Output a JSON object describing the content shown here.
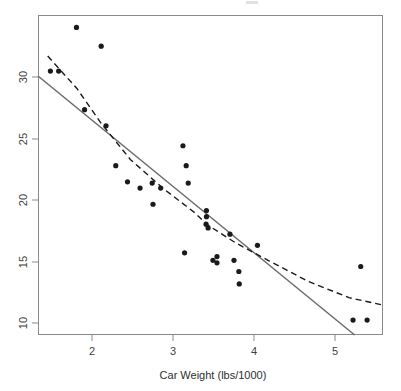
{
  "figure": {
    "background_color": "#ffffff",
    "panel": {
      "x": 38,
      "y": 15,
      "width": 345,
      "height": 320
    },
    "border_color": "#8a8a8a"
  },
  "axes": {
    "x": {
      "title": "Car Weight (lbs/1000)",
      "ticks": [
        "2",
        "3",
        "4",
        "5"
      ],
      "tick_values": [
        2,
        3,
        4,
        5
      ],
      "range": [
        1.36,
        5.62
      ],
      "pixel_per_unit": 81,
      "tick_pixels": [
        92,
        173,
        254,
        335
      ]
    },
    "y": {
      "title": "",
      "ticks": [
        "10",
        "15",
        "20",
        "25",
        "30"
      ],
      "tick_values": [
        10,
        15,
        20,
        25,
        30
      ],
      "range": [
        9.2,
        34.9
      ],
      "pixel_per_unit": 12.3,
      "tick_pixels": [
        323,
        262,
        200,
        139,
        77
      ]
    }
  },
  "chart_data": {
    "type": "scatter",
    "title": "",
    "xlabel": "Car Weight (lbs/1000)",
    "ylabel": "",
    "xlim": [
      1.36,
      5.62
    ],
    "ylim": [
      9.2,
      34.9
    ],
    "grid": false,
    "legend": "none",
    "point_color": "#1a1a1a",
    "point_radius": 2.6,
    "x": [
      1.835,
      2.14,
      1.513,
      1.615,
      1.935,
      2.2,
      2.32,
      2.465,
      2.62,
      2.77,
      2.78,
      2.875,
      3.15,
      3.19,
      3.215,
      3.17,
      3.44,
      3.44,
      3.435,
      3.46,
      3.52,
      3.57,
      3.57,
      3.73,
      3.78,
      3.84,
      3.845,
      4.07,
      5.25,
      5.345,
      5.424
    ],
    "y": [
      33.9,
      32.4,
      30.4,
      30.4,
      27.3,
      26.0,
      22.8,
      21.5,
      21.0,
      21.4,
      19.7,
      21.0,
      24.4,
      22.8,
      21.4,
      15.8,
      19.2,
      18.7,
      18.1,
      17.8,
      15.2,
      15.5,
      15.0,
      17.3,
      15.2,
      14.3,
      13.3,
      16.4,
      10.4,
      14.7,
      10.4
    ],
    "series": [
      {
        "name": "points",
        "kind": "scatter"
      },
      {
        "name": "linear-fit",
        "kind": "line",
        "style": "solid",
        "color": "#6b6b6b",
        "description": "Ordinary least squares straight-line fit",
        "endpoints": [
          [
            1.36,
            30.0
          ],
          [
            5.27,
            9.2
          ]
        ]
      },
      {
        "name": "smooth-fit",
        "kind": "line",
        "style": "dashed",
        "color": "#1a1a1a",
        "description": "Curved / smoothed regression fit",
        "path_points": [
          [
            1.48,
            31.6
          ],
          [
            1.84,
            29.0
          ],
          [
            2.14,
            26.2
          ],
          [
            2.5,
            23.3
          ],
          [
            2.9,
            21.0
          ],
          [
            3.3,
            19.0
          ],
          [
            3.44,
            18.1
          ],
          [
            3.8,
            16.6
          ],
          [
            4.2,
            15.2
          ],
          [
            4.7,
            13.5
          ],
          [
            5.2,
            12.2
          ],
          [
            5.62,
            11.6
          ]
        ]
      }
    ]
  }
}
